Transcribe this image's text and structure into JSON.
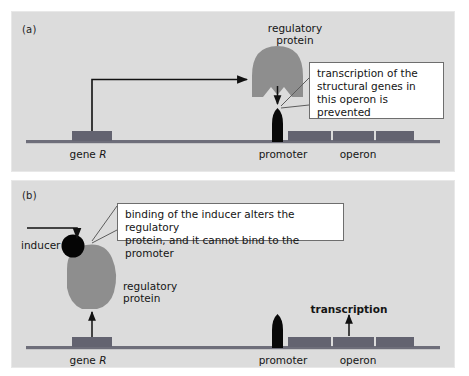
{
  "figure": {
    "background_color": "#ffffff",
    "panel_color": "#dcdcdc",
    "dna_color": "#6e6e7a",
    "gene_block_color": "#636370",
    "protein_color": "#8e8e8e",
    "promoter_color": "#080808",
    "inducer_color": "#050505",
    "line_color": "#111111"
  },
  "panels": [
    {
      "id": "a",
      "label": "(a)",
      "protein_label": "regulatory\nprotein",
      "protein_label_line1": "regulatory",
      "protein_label_line2": "protein",
      "callout": "transcription of the\nstructural genes in\nthis operon is\nprevented",
      "dna_labels": {
        "gene": "gene R",
        "gene_prefix": "gene ",
        "gene_italic": "R",
        "promoter": "promoter",
        "operon": "operon"
      }
    },
    {
      "id": "b",
      "label": "(b)",
      "inducer_label": "inducer",
      "protein_label_line1": "regulatory",
      "protein_label_line2": "protein",
      "callout": "binding of the inducer alters the regulatory\nprotein, and it cannot bind to the promoter",
      "transcription_label": "transcription",
      "dna_labels": {
        "gene": "gene R",
        "gene_prefix": "gene ",
        "gene_italic": "R",
        "promoter": "promoter",
        "operon": "operon"
      }
    }
  ]
}
